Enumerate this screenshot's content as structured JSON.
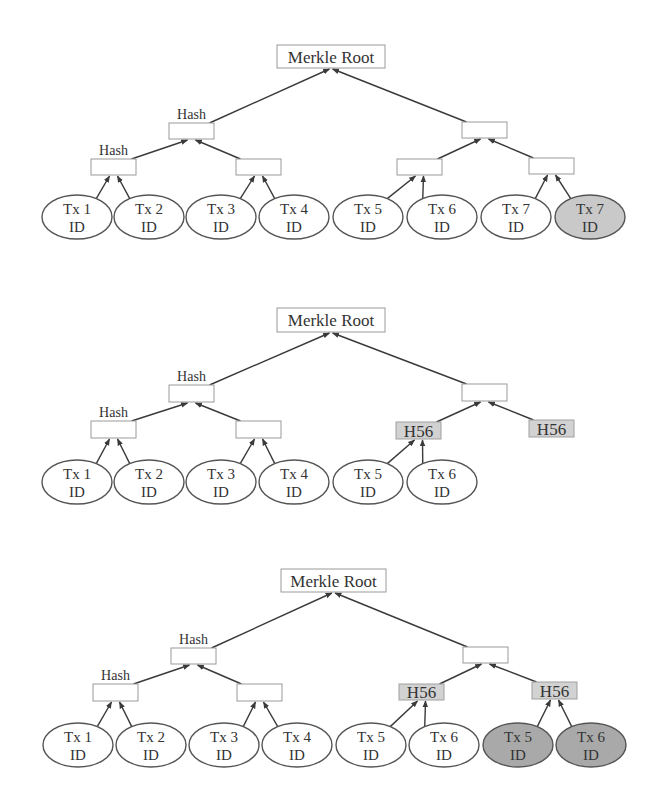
{
  "colors": {
    "edge": "#3a3a3a",
    "box_border": "#9a9a9a",
    "box_shaded": "#d2d2d2",
    "oval_light_gray": "#c9c9c9",
    "oval_dark_gray": "#a9a9a9"
  },
  "diagrams": [
    {
      "id": "merkle-tree-odd-leaves",
      "root": {
        "label": "Merkle Root",
        "x": 277,
        "y": 45,
        "w": 108,
        "h": 23
      },
      "boxes": [
        {
          "id": "L1a",
          "label": "",
          "caption": "Hash",
          "x": 169,
          "y": 123,
          "w": 45,
          "h": 16
        },
        {
          "id": "L1b",
          "label": "",
          "caption": "",
          "x": 462,
          "y": 122,
          "w": 45,
          "h": 16
        },
        {
          "id": "L2a",
          "label": "",
          "caption": "Hash",
          "x": 91,
          "y": 159,
          "w": 45,
          "h": 16
        },
        {
          "id": "L2b",
          "label": "",
          "caption": "",
          "x": 236,
          "y": 159,
          "w": 45,
          "h": 16
        },
        {
          "id": "L2c",
          "label": "",
          "caption": "",
          "x": 397,
          "y": 159,
          "w": 45,
          "h": 16
        },
        {
          "id": "L2d",
          "label": "",
          "caption": "",
          "x": 529,
          "y": 158,
          "w": 45,
          "h": 16
        }
      ],
      "leaves": [
        {
          "line1": "Tx 1",
          "line2": "ID",
          "cx": 77,
          "cy": 217,
          "fill": "white"
        },
        {
          "line1": "Tx 2",
          "line2": "ID",
          "cx": 149,
          "cy": 217,
          "fill": "white"
        },
        {
          "line1": "Tx 3",
          "line2": "ID",
          "cx": 221,
          "cy": 217,
          "fill": "white"
        },
        {
          "line1": "Tx 4",
          "line2": "ID",
          "cx": 294,
          "cy": 217,
          "fill": "white"
        },
        {
          "line1": "Tx 5",
          "line2": "ID",
          "cx": 368,
          "cy": 217,
          "fill": "white"
        },
        {
          "line1": "Tx 6",
          "line2": "ID",
          "cx": 442,
          "cy": 217,
          "fill": "white"
        },
        {
          "line1": "Tx 7",
          "line2": "ID",
          "cx": 516,
          "cy": 217,
          "fill": "white"
        },
        {
          "line1": "Tx 7",
          "line2": "ID",
          "cx": 590,
          "cy": 217,
          "fill": "light"
        }
      ],
      "edges": [
        [
          "L1a",
          "root"
        ],
        [
          "L1b",
          "root"
        ],
        [
          "L2a",
          "L1a"
        ],
        [
          "L2b",
          "L1a"
        ],
        [
          "L2c",
          "L1b"
        ],
        [
          "L2d",
          "L1b"
        ],
        [
          "leaf0",
          "L2a"
        ],
        [
          "leaf1",
          "L2a"
        ],
        [
          "leaf2",
          "L2b"
        ],
        [
          "leaf3",
          "L2b"
        ],
        [
          "leaf4",
          "L2c"
        ],
        [
          "leaf5",
          "L2c"
        ],
        [
          "leaf6",
          "L2d"
        ],
        [
          "leaf7",
          "L2d"
        ]
      ]
    },
    {
      "id": "merkle-tree-duplicated-hash",
      "root": {
        "label": "Merkle Root",
        "x": 277,
        "y": 308,
        "w": 108,
        "h": 24
      },
      "boxes": [
        {
          "id": "L1a",
          "label": "",
          "caption": "Hash",
          "x": 169,
          "y": 385,
          "w": 45,
          "h": 17
        },
        {
          "id": "L1b",
          "label": "",
          "caption": "",
          "x": 462,
          "y": 384,
          "w": 45,
          "h": 17
        },
        {
          "id": "L2a",
          "label": "",
          "caption": "Hash",
          "x": 91,
          "y": 421,
          "w": 45,
          "h": 17
        },
        {
          "id": "L2b",
          "label": "",
          "caption": "",
          "x": 236,
          "y": 421,
          "w": 45,
          "h": 17
        },
        {
          "id": "L2c",
          "label": "H56",
          "caption": "",
          "x": 396,
          "y": 422,
          "w": 45,
          "h": 17,
          "shaded": true
        },
        {
          "id": "L2d",
          "label": "H56",
          "caption": "",
          "x": 529,
          "y": 420,
          "w": 45,
          "h": 17,
          "shaded": true
        }
      ],
      "leaves": [
        {
          "line1": "Tx 1",
          "line2": "ID",
          "cx": 77,
          "cy": 482,
          "fill": "white"
        },
        {
          "line1": "Tx 2",
          "line2": "ID",
          "cx": 149,
          "cy": 482,
          "fill": "white"
        },
        {
          "line1": "Tx 3",
          "line2": "ID",
          "cx": 221,
          "cy": 482,
          "fill": "white"
        },
        {
          "line1": "Tx 4",
          "line2": "ID",
          "cx": 294,
          "cy": 482,
          "fill": "white"
        },
        {
          "line1": "Tx 5",
          "line2": "ID",
          "cx": 368,
          "cy": 482,
          "fill": "white"
        },
        {
          "line1": "Tx 6",
          "line2": "ID",
          "cx": 442,
          "cy": 482,
          "fill": "white"
        }
      ],
      "edges": [
        [
          "L1a",
          "root"
        ],
        [
          "L1b",
          "root"
        ],
        [
          "L2a",
          "L1a"
        ],
        [
          "L2b",
          "L1a"
        ],
        [
          "L2c",
          "L1b"
        ],
        [
          "L2d",
          "L1b"
        ],
        [
          "leaf0",
          "L2a"
        ],
        [
          "leaf1",
          "L2a"
        ],
        [
          "leaf2",
          "L2b"
        ],
        [
          "leaf3",
          "L2b"
        ],
        [
          "leaf4",
          "L2c"
        ],
        [
          "leaf5",
          "L2c"
        ]
      ]
    },
    {
      "id": "merkle-tree-duplicated-leaves",
      "root": {
        "label": "Merkle Root",
        "x": 281,
        "y": 569,
        "w": 105,
        "h": 23
      },
      "boxes": [
        {
          "id": "L1a",
          "label": "",
          "caption": "Hash",
          "x": 171,
          "y": 648,
          "w": 45,
          "h": 16
        },
        {
          "id": "L1b",
          "label": "",
          "caption": "",
          "x": 463,
          "y": 647,
          "w": 45,
          "h": 16
        },
        {
          "id": "L2a",
          "label": "",
          "caption": "Hash",
          "x": 93,
          "y": 684,
          "w": 45,
          "h": 17
        },
        {
          "id": "L2b",
          "label": "",
          "caption": "",
          "x": 237,
          "y": 684,
          "w": 45,
          "h": 17
        },
        {
          "id": "L2c",
          "label": "H56",
          "caption": "",
          "x": 399,
          "y": 684,
          "w": 45,
          "h": 16,
          "shaded": true
        },
        {
          "id": "L2d",
          "label": "H56",
          "caption": "",
          "x": 532,
          "y": 682,
          "w": 45,
          "h": 17,
          "shaded": true
        }
      ],
      "leaves": [
        {
          "line1": "Tx 1",
          "line2": "ID",
          "cx": 78,
          "cy": 745,
          "fill": "white"
        },
        {
          "line1": "Tx 2",
          "line2": "ID",
          "cx": 151,
          "cy": 745,
          "fill": "white"
        },
        {
          "line1": "Tx 3",
          "line2": "ID",
          "cx": 224,
          "cy": 745,
          "fill": "white"
        },
        {
          "line1": "Tx 4",
          "line2": "ID",
          "cx": 297,
          "cy": 745,
          "fill": "white"
        },
        {
          "line1": "Tx 5",
          "line2": "ID",
          "cx": 371,
          "cy": 745,
          "fill": "white"
        },
        {
          "line1": "Tx 6",
          "line2": "ID",
          "cx": 444,
          "cy": 745,
          "fill": "white"
        },
        {
          "line1": "Tx 5",
          "line2": "ID",
          "cx": 518,
          "cy": 745,
          "fill": "dark"
        },
        {
          "line1": "Tx 6",
          "line2": "ID",
          "cx": 591,
          "cy": 745,
          "fill": "dark"
        }
      ],
      "edges": [
        [
          "L1a",
          "root"
        ],
        [
          "L1b",
          "root"
        ],
        [
          "L2a",
          "L1a"
        ],
        [
          "L2b",
          "L1a"
        ],
        [
          "L2c",
          "L1b"
        ],
        [
          "L2d",
          "L1b"
        ],
        [
          "leaf0",
          "L2a"
        ],
        [
          "leaf1",
          "L2a"
        ],
        [
          "leaf2",
          "L2b"
        ],
        [
          "leaf3",
          "L2b"
        ],
        [
          "leaf4",
          "L2c"
        ],
        [
          "leaf5",
          "L2c"
        ],
        [
          "leaf6",
          "L2d"
        ],
        [
          "leaf7",
          "L2d"
        ]
      ]
    }
  ],
  "leaf_geometry": {
    "rx": 35,
    "ry": 22
  }
}
